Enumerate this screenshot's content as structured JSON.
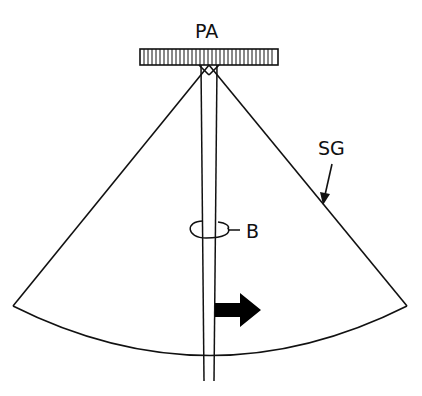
{
  "diagram": {
    "labels": {
      "pa": "PA",
      "sg": "SG",
      "b": "B"
    },
    "elements": [
      {
        "id": "pa",
        "description": "probe array (hatched bar)"
      },
      {
        "id": "sg",
        "description": "sector geometry outline"
      },
      {
        "id": "beam",
        "description": "narrow beam from array center"
      },
      {
        "id": "b",
        "description": "beam cross-section ring"
      },
      {
        "id": "arrow",
        "description": "rightward solid arrow indicating steering direction"
      }
    ],
    "colors": {
      "line": "#111111",
      "background": "#ffffff"
    }
  }
}
